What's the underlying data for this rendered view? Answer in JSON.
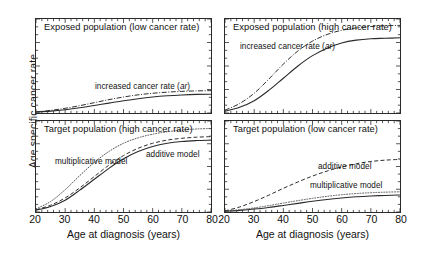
{
  "figure": {
    "y_axis_label": "Age specific cancer rate",
    "x_axis_label_left": "Age at diagnosis (years)",
    "x_axis_label_right": "Age at diagnosis (years)"
  },
  "axes": {
    "x_tick_labels": [
      "20",
      "30",
      "40",
      "50",
      "60",
      "70",
      "80"
    ],
    "x_min": 20,
    "x_max": 80,
    "x_major_step": 10,
    "x_minor_step": 2
  },
  "panels": {
    "top_left": {
      "title": "Exposed population (low cancer rate)"
    },
    "top_right": {
      "title": "Exposed population (high cancer rate)"
    },
    "bottom_left": {
      "title": "Target population (high cancer rate)"
    },
    "bottom_right": {
      "title": "Target population (low cancer rate)"
    }
  },
  "annotations": {
    "increased_rate_tl_pre": "increased cancer rate (",
    "increased_rate_tl_em": "ar",
    "increased_rate_tl_post": ")",
    "increased_rate_tr_pre": "increased cancer rate (",
    "increased_rate_tr_em": "ar",
    "increased_rate_tr_post": ")",
    "multiplicative_bl": "multiplicative model",
    "additive_bl": "additive model",
    "additive_br": "additive model",
    "multiplicative_br": "multiplicative model"
  },
  "colors": {
    "line": "#2a2a2a",
    "axis": "#2a2a2a",
    "background": "#ffffff",
    "text": "#111111"
  },
  "chart_data": {
    "type": "line",
    "xlabel": "Age at diagnosis (years)",
    "ylabel": "Age specific cancer rate",
    "xlim": [
      20,
      80
    ],
    "ylim": [
      0,
      1
    ],
    "grid": false,
    "legend": "inline annotations",
    "x": [
      20,
      25,
      30,
      35,
      40,
      45,
      50,
      55,
      60,
      65,
      70,
      75,
      80
    ],
    "panels": [
      {
        "id": "top_left",
        "title": "Exposed population (low cancer rate)",
        "series": [
          {
            "name": "baseline cancer rate",
            "style": "solid",
            "values": [
              0.01,
              0.02,
              0.035,
              0.055,
              0.08,
              0.105,
              0.13,
              0.152,
              0.17,
              0.183,
              0.192,
              0.198,
              0.2
            ]
          },
          {
            "name": "increased cancer rate (ar)",
            "style": "dash-dot",
            "values": [
              0.012,
              0.028,
              0.05,
              0.078,
              0.11,
              0.142,
              0.17,
              0.193,
              0.21,
              0.222,
              0.23,
              0.235,
              0.238
            ]
          }
        ]
      },
      {
        "id": "top_right",
        "title": "Exposed population (high cancer rate)",
        "series": [
          {
            "name": "baseline cancer rate",
            "style": "solid",
            "values": [
              0.02,
              0.06,
              0.13,
              0.24,
              0.37,
              0.5,
              0.61,
              0.69,
              0.745,
              0.775,
              0.79,
              0.795,
              0.8
            ]
          },
          {
            "name": "increased cancer rate (ar)",
            "style": "dash-dot",
            "values": [
              0.03,
              0.1,
              0.21,
              0.36,
              0.52,
              0.66,
              0.765,
              0.835,
              0.88,
              0.905,
              0.92,
              0.928,
              0.932
            ]
          }
        ]
      },
      {
        "id": "bottom_left",
        "title": "Target population (high cancer rate)",
        "series": [
          {
            "name": "baseline cancer rate",
            "style": "solid",
            "values": [
              0.02,
              0.06,
              0.13,
              0.24,
              0.36,
              0.48,
              0.585,
              0.665,
              0.72,
              0.755,
              0.775,
              0.785,
              0.79
            ]
          },
          {
            "name": "additive model",
            "style": "dashed",
            "values": [
              0.025,
              0.075,
              0.155,
              0.265,
              0.39,
              0.515,
              0.62,
              0.7,
              0.755,
              0.79,
              0.81,
              0.822,
              0.828
            ]
          },
          {
            "name": "multiplicative model",
            "style": "dotted",
            "values": [
              0.035,
              0.115,
              0.245,
              0.4,
              0.545,
              0.665,
              0.755,
              0.815,
              0.855,
              0.882,
              0.9,
              0.912,
              0.918
            ]
          }
        ]
      },
      {
        "id": "bottom_right",
        "title": "Target population (low cancer rate)",
        "series": [
          {
            "name": "baseline cancer rate",
            "style": "solid",
            "values": [
              0.008,
              0.018,
              0.032,
              0.05,
              0.072,
              0.095,
              0.118,
              0.138,
              0.154,
              0.167,
              0.176,
              0.182,
              0.186
            ]
          },
          {
            "name": "multiplicative model",
            "style": "dotted",
            "values": [
              0.01,
              0.025,
              0.045,
              0.07,
              0.098,
              0.125,
              0.15,
              0.172,
              0.19,
              0.203,
              0.212,
              0.218,
              0.222
            ]
          },
          {
            "name": "additive model",
            "style": "dashed",
            "values": [
              0.012,
              0.055,
              0.115,
              0.185,
              0.26,
              0.33,
              0.395,
              0.45,
              0.495,
              0.53,
              0.555,
              0.57,
              0.578
            ]
          }
        ]
      }
    ]
  }
}
